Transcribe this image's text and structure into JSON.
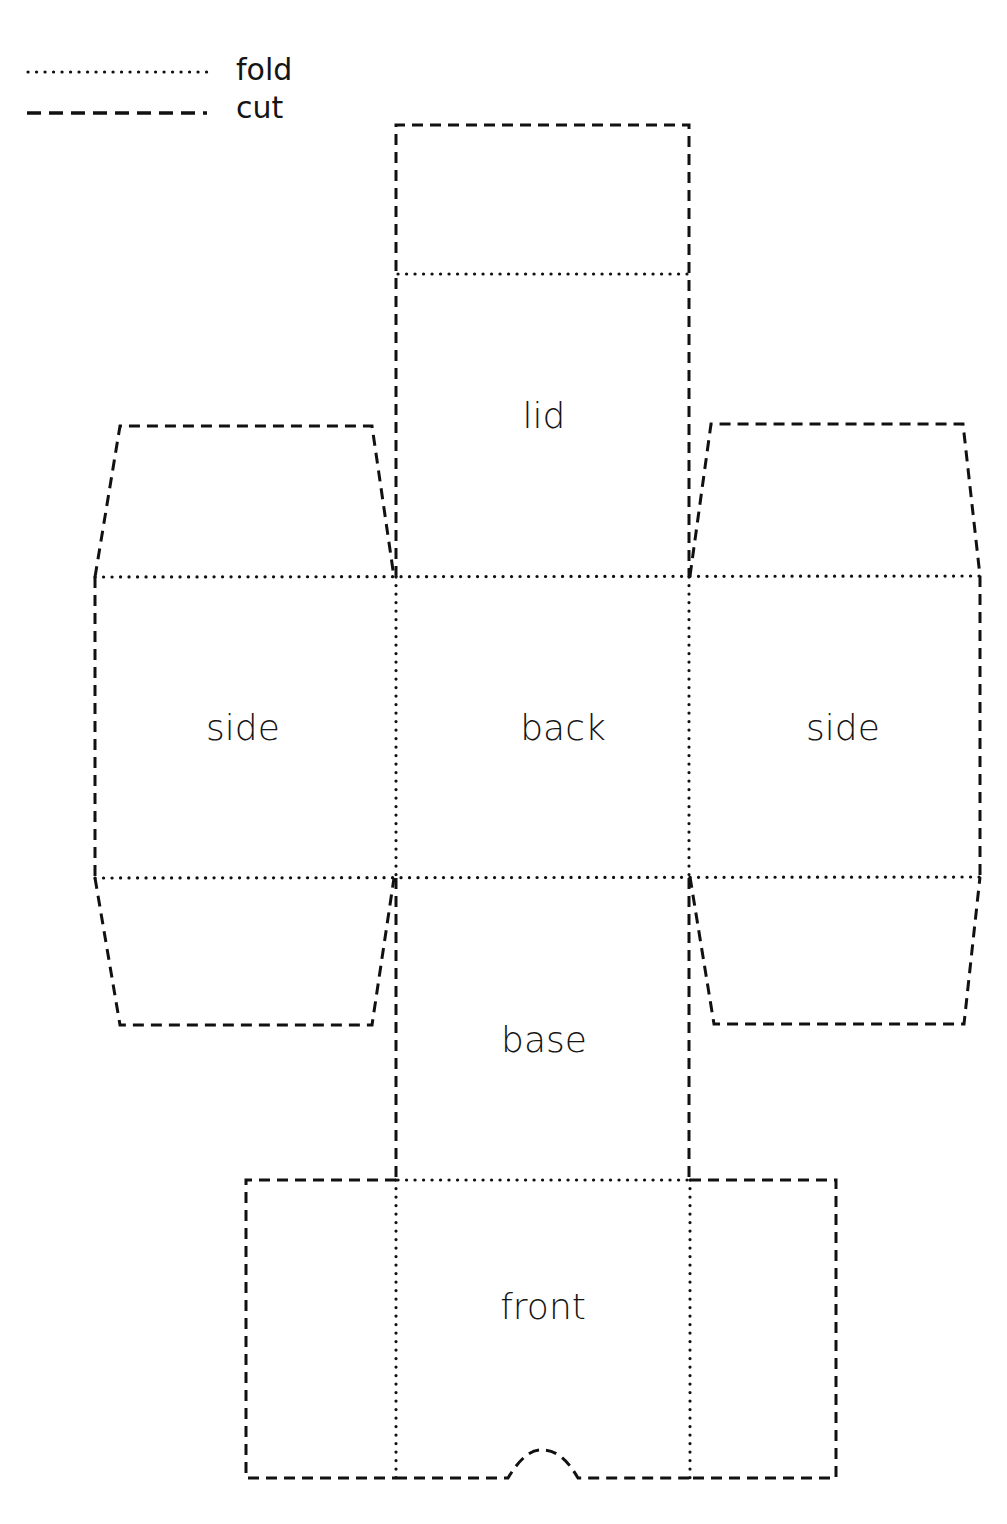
{
  "legend": {
    "fold_label": "fold",
    "cut_label": "cut"
  },
  "panels": {
    "lid": "lid",
    "back": "back",
    "side_left": "side",
    "side_right": "side",
    "base": "base",
    "front": "front"
  },
  "colors": {
    "line": "#111111",
    "background": "#ffffff",
    "text": "#151515"
  }
}
